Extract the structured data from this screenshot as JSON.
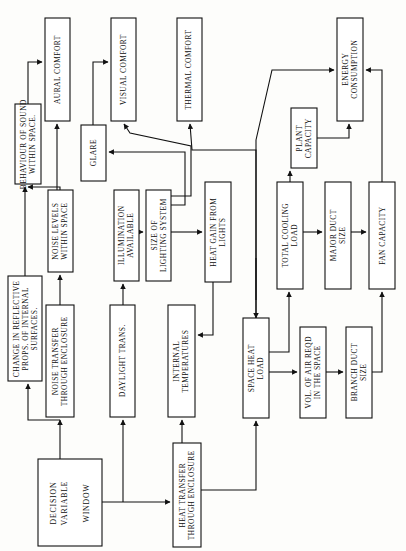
{
  "diagram": {
    "orientation": "rotated-90",
    "canvas": {
      "width": 406,
      "height": 551
    },
    "style": {
      "box_fill": "#ffffff",
      "box_stroke": "#111111",
      "line": "#111111",
      "background": "#fdfdfb"
    },
    "nodes": [
      {
        "id": "aural_comfort",
        "label": "AURAL COMFORT",
        "lines": [
          "AURAL COMFORT"
        ],
        "x": 45,
        "y": 18,
        "w": 25,
        "h": 103
      },
      {
        "id": "visual_comfort",
        "label": "VISUAL COMFORT",
        "lines": [
          "VISUAL COMFORT"
        ],
        "x": 111,
        "y": 18,
        "w": 25,
        "h": 103
      },
      {
        "id": "thermal_comfort",
        "label": "THERMAL COMFORT",
        "lines": [
          "THERMAL COMFORT"
        ],
        "x": 177,
        "y": 18,
        "w": 25,
        "h": 103
      },
      {
        "id": "energy_consumption",
        "label": "ENERGY CONSUMPTION",
        "lines": [
          "ENERGY",
          "CONSUMPTION"
        ],
        "x": 337,
        "y": 18,
        "w": 26,
        "h": 103
      },
      {
        "id": "behaviour_sound",
        "label": "BEHAVIOUR OF SOUND WITHIN SPACE",
        "lines": [
          "BEHAVIOUR OF SOUND",
          "WITHIN SPACE."
        ],
        "x": 15,
        "y": 104,
        "w": 26,
        "h": 80
      },
      {
        "id": "glare",
        "label": "GLARE",
        "lines": [
          "GLARE"
        ],
        "x": 81,
        "y": 125,
        "w": 25,
        "h": 56
      },
      {
        "id": "plant_capacity",
        "label": "PLANT CAPACITY",
        "lines": [
          "PLANT",
          "CAPACITY"
        ],
        "x": 291,
        "y": 108,
        "w": 26,
        "h": 60
      },
      {
        "id": "change_reflective",
        "label": "CHANGE IN REFLECTIVE PROPS. OF INTERNAL SURFACES.",
        "lines": [
          "CHANGE IN REFLECTIVE",
          "PROPS. OF INTERNAL",
          "SURFACES."
        ],
        "x": 8,
        "y": 276,
        "w": 34,
        "h": 105
      },
      {
        "id": "noise_levels",
        "label": "NOISE LEVELS WITHIN SPACE",
        "lines": [
          "NOISE LEVELS",
          "WITHIN SPACE"
        ],
        "x": 48,
        "y": 190,
        "w": 25,
        "h": 82
      },
      {
        "id": "illumination",
        "label": "ILLUMINATION AVAILABLE",
        "lines": [
          "ILLUMINATION",
          "AVAILABLE"
        ],
        "x": 114,
        "y": 190,
        "w": 25,
        "h": 91
      },
      {
        "id": "size_lighting",
        "label": "SIZE OF LIGHTING SYSTEM",
        "lines": [
          "SIZE OF",
          "LIGHTING SYSTEM"
        ],
        "x": 146,
        "y": 190,
        "w": 25,
        "h": 91
      },
      {
        "id": "heat_gain_lights",
        "label": "HEAT GAIN FROM LIGHTS",
        "lines": [
          "HEAT GAIN FROM",
          "LIGHTS"
        ],
        "x": 205,
        "y": 182,
        "w": 26,
        "h": 100
      },
      {
        "id": "total_cooling",
        "label": "TOTAL COOLING LOAD",
        "lines": [
          "TOTAL COOLING",
          "LOAD"
        ],
        "x": 277,
        "y": 182,
        "w": 26,
        "h": 107
      },
      {
        "id": "major_duct",
        "label": "MAJOR DUCT SIZE",
        "lines": [
          "MAJOR DUCT",
          "SIZE"
        ],
        "x": 325,
        "y": 182,
        "w": 26,
        "h": 107
      },
      {
        "id": "fan_capacity",
        "label": "FAN CAPACITY",
        "lines": [
          "FAN CAPACITY"
        ],
        "x": 369,
        "y": 182,
        "w": 26,
        "h": 107
      },
      {
        "id": "noise_transfer",
        "label": "NOISE TRANSFER THROUGH ENCLOSURE",
        "lines": [
          "NOISE TRANSFER",
          "THROUGH ENCLOSURE"
        ],
        "x": 46,
        "y": 305,
        "w": 28,
        "h": 112
      },
      {
        "id": "daylight_trans",
        "label": "DAYLIGHT TRANS.",
        "lines": [
          "DAYLIGHT TRANS."
        ],
        "x": 110,
        "y": 305,
        "w": 25,
        "h": 112
      },
      {
        "id": "internal_temps",
        "label": "INTERNAL TEMPERATURES",
        "lines": [
          "INTERNAL",
          "TEMPERATURES"
        ],
        "x": 168,
        "y": 305,
        "w": 27,
        "h": 112
      },
      {
        "id": "space_heat_load",
        "label": "SPACE HEAT LOAD",
        "lines": [
          "SPACE HEAT",
          "LOAD"
        ],
        "x": 243,
        "y": 318,
        "w": 26,
        "h": 100
      },
      {
        "id": "vol_air_reqd",
        "label": "VOL. OF AIR REQD IN THE SPACE",
        "lines": [
          "VOL. OF AIR REQD",
          "IN THE SPACE"
        ],
        "x": 300,
        "y": 327,
        "w": 26,
        "h": 91
      },
      {
        "id": "branch_duct",
        "label": "BRANCH DUCT SIZE",
        "lines": [
          "BRANCH DUCT",
          "SIZE"
        ],
        "x": 346,
        "y": 327,
        "w": 26,
        "h": 91
      },
      {
        "id": "decision_variable",
        "label": "DECISION VARIABLE WINDOW",
        "lines": [
          "DECISION",
          "VARIABLE",
          "",
          "WINDOW"
        ],
        "x": 38,
        "y": 459,
        "w": 64,
        "h": 87,
        "big": true
      },
      {
        "id": "heat_transfer",
        "label": "HEAT TRANSFER THROUGH ENCLOSURE",
        "lines": [
          "HEAT TRANSFER",
          "THROUGH ENCLOSURE"
        ],
        "x": 173,
        "y": 443,
        "w": 28,
        "h": 104
      }
    ],
    "edges": [
      {
        "id": "e-behaviour-aural",
        "from": "behaviour_sound",
        "to": "aural_comfort",
        "path": "M 28,104 L 28,62 L 42,62",
        "arrow": "right"
      },
      {
        "id": "e-noise-behaviour",
        "from": "noise_levels",
        "to": "behaviour_sound",
        "path": "M 60,190 L 60,187 L 28,187",
        "arrow": "up-into-box"
      },
      {
        "id": "e-noise-aural",
        "from": "noise_levels",
        "to": "aural_comfort",
        "path": "M 57,190 L 57,124",
        "arrow": "up"
      },
      {
        "id": "e-glare-visual",
        "from": "glare",
        "to": "visual_comfort",
        "path": "M 93,125 L 93,62 L 108,62",
        "arrow": "right"
      },
      {
        "id": "e-illum-size",
        "from": "illumination",
        "to": "size_lighting",
        "path": "M 139,232 L 143,232",
        "arrow": "right"
      },
      {
        "id": "e-daylight-illum",
        "from": "daylight_trans",
        "to": "illumination",
        "path": "M 123,305 L 123,284",
        "arrow": "up"
      },
      {
        "id": "e-size-glare",
        "from": "size_lighting",
        "to": "glare",
        "path": "M 171,205 L 185,205 L 185,152 L 109,152",
        "arrow": "left"
      },
      {
        "id": "e-size-visual",
        "from": "size_lighting",
        "to": "visual_comfort",
        "path": "M 171,196 L 191,196 L 191,146 L 130,133 L 124,124",
        "arrow": "up"
      },
      {
        "id": "e-size-heat",
        "from": "size_lighting",
        "to": "heat_gain_lights",
        "path": "M 171,232 L 202,232",
        "arrow": "right"
      },
      {
        "id": "e-spaceheat-thermal",
        "from": "space_heat_load",
        "to": "thermal_comfort",
        "path": "M 256,318 L 256,150 L 192,150 L 190,124",
        "arrow": "up"
      },
      {
        "id": "e-spaceheat-energy",
        "from": "space_heat_load",
        "to": "energy_consumption",
        "path": "M 256,300 L 256,140 L 272,70 L 334,70",
        "arrow": "right"
      },
      {
        "id": "e-heatgain-internal",
        "from": "heat_gain_lights",
        "to": "internal_temps",
        "path": "M 213,282 L 213,335 L 198,335",
        "arrow": "left"
      },
      {
        "id": "e-internal-spaceheat",
        "from": "internal_temps",
        "to": "space_heat_load",
        "path": "M 256,305 L 256,258 L 256,318",
        "arrow": "down"
      },
      {
        "id": "e-spaceheat-total",
        "from": "space_heat_load",
        "to": "total_cooling",
        "path": "M 269,352 L 289,352 L 289,292",
        "arrow": "up"
      },
      {
        "id": "e-spaceheat-vol",
        "from": "space_heat_load",
        "to": "vol_air_reqd",
        "path": "M 269,372 L 297,372",
        "arrow": "right"
      },
      {
        "id": "e-total-plant",
        "from": "total_cooling",
        "to": "plant_capacity",
        "path": "M 290,182 L 290,171",
        "arrow": "up"
      },
      {
        "id": "e-plant-energy",
        "from": "plant_capacity",
        "to": "energy_consumption",
        "path": "M 317,138 L 349,138 L 349,124",
        "arrow": "up"
      },
      {
        "id": "e-total-major",
        "from": "total_cooling",
        "to": "major_duct",
        "path": "M 303,232 L 322,232",
        "arrow": "right"
      },
      {
        "id": "e-major-fan",
        "from": "major_duct",
        "to": "fan_capacity",
        "path": "M 351,232 L 366,232",
        "arrow": "right"
      },
      {
        "id": "e-vol-branch",
        "from": "vol_air_reqd",
        "to": "branch_duct",
        "path": "M 326,372 L 343,372",
        "arrow": "right"
      },
      {
        "id": "e-branch-fan",
        "from": "branch_duct",
        "to": "fan_capacity",
        "path": "M 372,372 L 382,372 L 382,292",
        "arrow": "up"
      },
      {
        "id": "e-fan-energy",
        "from": "fan_capacity",
        "to": "energy_consumption",
        "path": "M 382,182 L 382,70 L 366,70",
        "arrow": "left"
      },
      {
        "id": "e-noisetrans-noise",
        "from": "noise_transfer",
        "to": "noise_levels",
        "path": "M 60,305 L 60,275",
        "arrow": "up"
      },
      {
        "id": "e-noisetrans-change",
        "from": "noise_transfer",
        "to": "change_reflective",
        "path": "M 60,420 L 28,420 L 28,384",
        "arrow": "up"
      },
      {
        "id": "e-change-behaviour",
        "from": "change_reflective",
        "to": "behaviour_sound",
        "path": "M 25,276 L 25,187",
        "arrow": "up"
      },
      {
        "id": "e-window-noisetrans",
        "from": "decision_variable",
        "to": "noise_transfer",
        "path": "M 60,459 L 60,420",
        "arrow": "up"
      },
      {
        "id": "e-window-daylight",
        "from": "decision_variable",
        "to": "daylight_trans",
        "path": "M 123,502 L 123,420",
        "arrow": "up"
      },
      {
        "id": "e-window-heattrans",
        "from": "decision_variable",
        "to": "heat_transfer",
        "path": "M 102,502 L 170,502",
        "arrow": "right"
      },
      {
        "id": "e-heattrans-internal",
        "from": "heat_transfer",
        "to": "internal_temps",
        "path": "M 182,443 L 182,420",
        "arrow": "up"
      },
      {
        "id": "e-heattrans-spaceheat",
        "from": "heat_transfer",
        "to": "space_heat_load",
        "path": "M 201,490 L 256,490 L 256,421",
        "arrow": "up"
      }
    ]
  }
}
